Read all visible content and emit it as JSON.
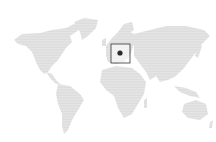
{
  "map": {
    "type": "world-dot-map",
    "land_color": "#cfcfcf",
    "background": "#ffffff",
    "marker": {
      "label": "",
      "region": "Central Europe",
      "box_color": "#333333",
      "dot_color": "#2a2a2a",
      "x": 120,
      "y": 53,
      "box": {
        "x": 111,
        "y": 44,
        "width": 19,
        "height": 19
      }
    }
  }
}
